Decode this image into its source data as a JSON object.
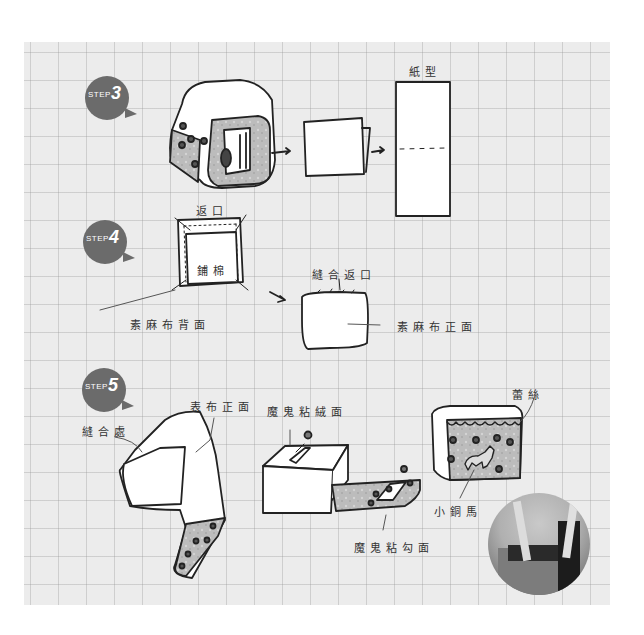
{
  "steps": [
    {
      "id": "step3",
      "label": "STEP",
      "number": "3"
    },
    {
      "id": "step4",
      "label": "STEP",
      "number": "4"
    },
    {
      "id": "step5",
      "label": "STEP",
      "number": "5"
    }
  ],
  "step3": {
    "pattern_label": "紙型"
  },
  "step4": {
    "opening_label": "返口",
    "batting_label": "鋪棉",
    "linen_back_label": "素麻布背面",
    "sew_opening_label": "縫合返口",
    "linen_front_label": "素麻布正面"
  },
  "step5": {
    "seam_label": "縫合處",
    "outer_front_label": "表布正面",
    "velcro_loop_label": "魔鬼粘絨面",
    "velcro_hook_label": "魔鬼粘勾面",
    "lace_label": "蕾絲",
    "pony_label": "小銅馬"
  },
  "colors": {
    "paper": "#ececec",
    "grid": "#b4b4b4",
    "badge": "#6b6b6b",
    "ink": "#222222",
    "fabric": "#bdbdbd"
  }
}
